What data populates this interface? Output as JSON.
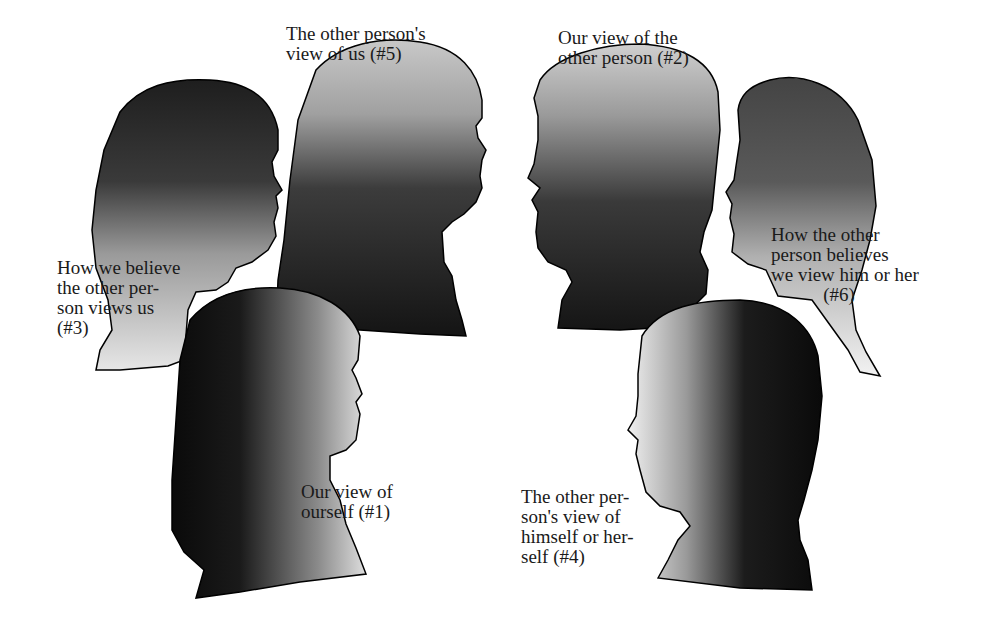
{
  "figure": {
    "views": [
      {
        "id": 1,
        "label": "Our view of\nourself (#1)"
      },
      {
        "id": 2,
        "label": "Our view of the\nother person (#2)"
      },
      {
        "id": 3,
        "label": "How we believe\nthe other per-\nson views us\n(#3)"
      },
      {
        "id": 4,
        "label": "The other per-\nson's view of\nhimself or her-\nself (#4)"
      },
      {
        "id": 5,
        "label": "The other person's\nview of us (#5)"
      },
      {
        "id": 6,
        "label": "How the other\nperson believes\nwe view him or her\n           (#6)"
      }
    ]
  },
  "colors": {
    "background": "#ffffff",
    "silhouette_dark": "#111111",
    "silhouette_light": "#e8e8e8",
    "outline": "#000000",
    "text": "#1a1a1a"
  }
}
